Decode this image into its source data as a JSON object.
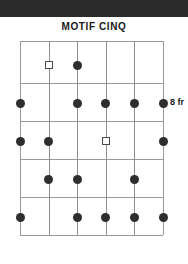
{
  "page": {
    "background_color": "#ffffff",
    "top_band_color": "#2b2b2b"
  },
  "header": {
    "title": "MOTIF CINQ"
  },
  "fret_label": {
    "text": "8 fr"
  },
  "diagram": {
    "type": "guitar-fretboard",
    "string_count": 6,
    "fret_count": 5,
    "grid_color": "#9a9a9a",
    "filled_dot_color": "#2e2e2e",
    "open_marker_color": "#4a4a4a",
    "string_x": [
      0,
      28.6,
      57.2,
      85.8,
      114.4,
      143
    ],
    "fret_y": [
      0,
      42,
      80,
      118,
      156,
      194
    ],
    "row_centers_y": [
      24,
      62,
      100,
      138,
      176
    ],
    "markers": [
      {
        "string": 2,
        "fret_row": 1,
        "kind": "open-square"
      },
      {
        "string": 3,
        "fret_row": 1,
        "kind": "filled"
      },
      {
        "string": 1,
        "fret_row": 2,
        "kind": "filled"
      },
      {
        "string": 3,
        "fret_row": 2,
        "kind": "filled"
      },
      {
        "string": 4,
        "fret_row": 2,
        "kind": "filled"
      },
      {
        "string": 5,
        "fret_row": 2,
        "kind": "filled"
      },
      {
        "string": 6,
        "fret_row": 2,
        "kind": "filled"
      },
      {
        "string": 1,
        "fret_row": 3,
        "kind": "filled"
      },
      {
        "string": 2,
        "fret_row": 3,
        "kind": "filled"
      },
      {
        "string": 4,
        "fret_row": 3,
        "kind": "open-square"
      },
      {
        "string": 6,
        "fret_row": 3,
        "kind": "filled"
      },
      {
        "string": 2,
        "fret_row": 4,
        "kind": "filled"
      },
      {
        "string": 3,
        "fret_row": 4,
        "kind": "filled"
      },
      {
        "string": 5,
        "fret_row": 4,
        "kind": "filled"
      },
      {
        "string": 1,
        "fret_row": 5,
        "kind": "filled"
      },
      {
        "string": 3,
        "fret_row": 5,
        "kind": "filled"
      },
      {
        "string": 4,
        "fret_row": 5,
        "kind": "filled"
      },
      {
        "string": 5,
        "fret_row": 5,
        "kind": "filled"
      },
      {
        "string": 6,
        "fret_row": 5,
        "kind": "filled"
      }
    ]
  }
}
